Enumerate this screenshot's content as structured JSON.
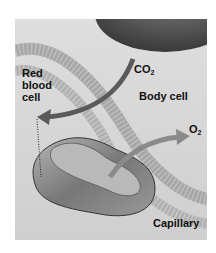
{
  "diagram": {
    "labels": {
      "red_blood_cell": [
        "Red",
        "blood",
        "cell"
      ],
      "co2": {
        "main": "CO",
        "sub": "2"
      },
      "body_cell": "Body cell",
      "o2": {
        "main": "O",
        "sub": "2"
      },
      "capillary": "Capillary"
    },
    "colors": {
      "background": "#d9d9d9",
      "body_cell": "#555555",
      "capillary_wall": "#a8a8a8",
      "red_blood_cell": "#8c8c8c",
      "co2_arrow": "#5a5a5a",
      "o2_arrow": "#8a8a8a",
      "text": "#111111"
    }
  }
}
